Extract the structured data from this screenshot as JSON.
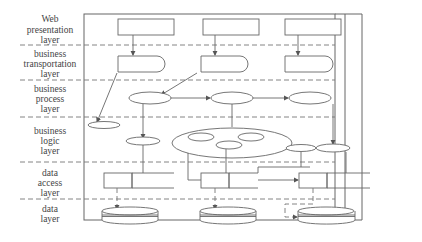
{
  "diagram": {
    "type": "layered-architecture",
    "layers": [
      {
        "id": "web",
        "lines": [
          "Web",
          "presentation",
          "layer"
        ]
      },
      {
        "id": "transport",
        "lines": [
          "business",
          "transportation",
          "layer"
        ]
      },
      {
        "id": "process",
        "lines": [
          "business",
          "process",
          "layer"
        ]
      },
      {
        "id": "logic",
        "lines": [
          "business",
          "logic",
          "layer"
        ]
      },
      {
        "id": "access",
        "lines": [
          "data",
          "access",
          "layer"
        ]
      },
      {
        "id": "data",
        "lines": [
          "data",
          "layer"
        ]
      }
    ],
    "colors": {
      "line": "#666666",
      "text": "#444444",
      "background": "#ffffff"
    }
  }
}
